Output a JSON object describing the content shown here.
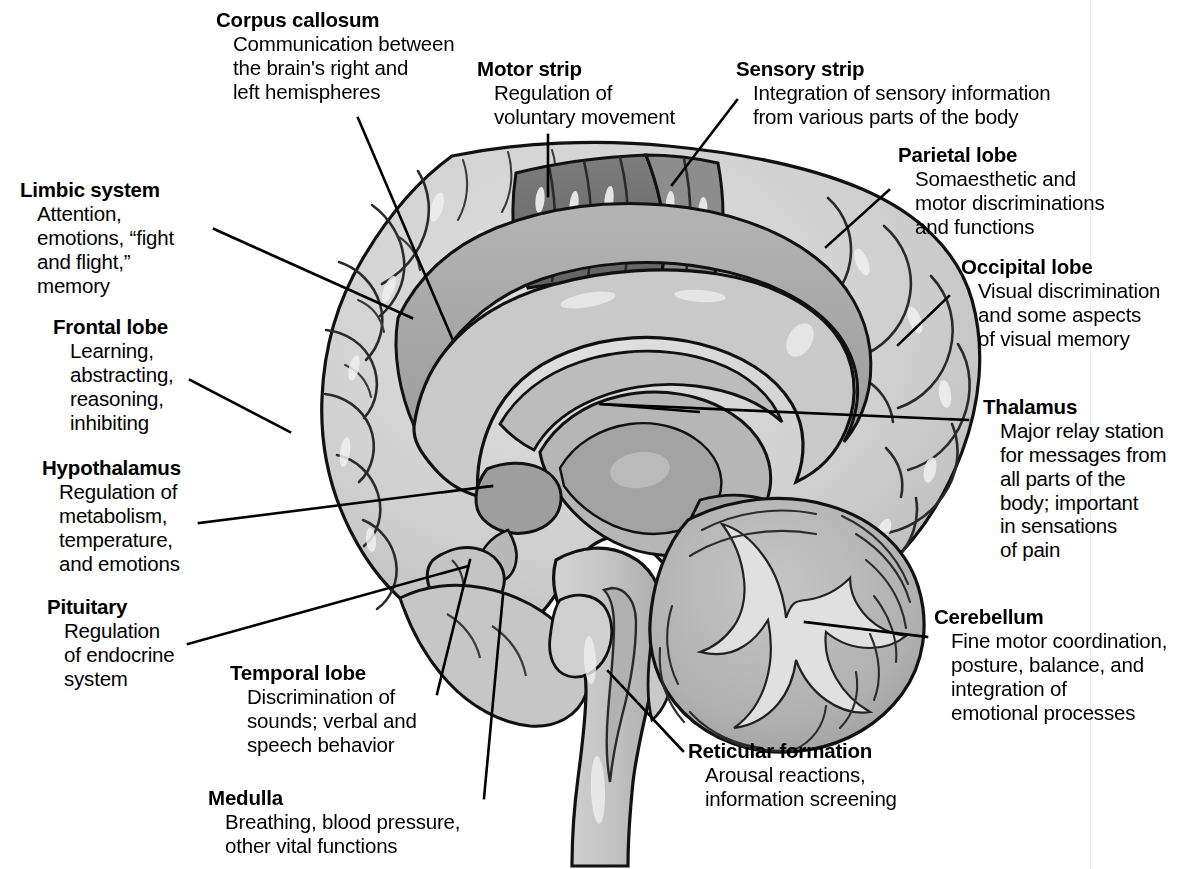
{
  "figure": {
    "background_color": "#ffffff",
    "text_color": "#000000",
    "illustration_style": "grayscale line drawing"
  },
  "palette": {
    "outline": "#111111",
    "cortex_light": "#d0d0d0",
    "cortex_mid": "#bdbdbd",
    "gyrus_band": "#a8a8a8",
    "corpus_callosum": "#c9c9c9",
    "motor_strip_dark": "#6f6f6f",
    "sensory_strip": "#8f8f8f",
    "thalamus": "#b3b3b3",
    "cerebellum": "#b0b0b0",
    "brainstem": "#c4c4c4",
    "highlight": "#f2f2f2"
  },
  "labels": [
    {
      "id": "corpus-callosum",
      "term": "Corpus callosum",
      "description": "Communication between\nthe brain's right and\nleft hemispheres",
      "side": "top-left"
    },
    {
      "id": "motor-strip",
      "term": "Motor strip",
      "description": "Regulation of\nvoluntary movement",
      "side": "top-center"
    },
    {
      "id": "sensory-strip",
      "term": "Sensory strip",
      "description": "Integration of sensory information\nfrom various parts of the body",
      "side": "top-right"
    },
    {
      "id": "parietal-lobe",
      "term": "Parietal lobe",
      "description": "Somaesthetic and\nmotor discriminations\nand functions",
      "side": "right"
    },
    {
      "id": "occipital-lobe",
      "term": "Occipital lobe",
      "description": "Visual discrimination\nand some aspects\nof visual memory",
      "side": "right"
    },
    {
      "id": "thalamus",
      "term": "Thalamus",
      "description": "Major relay station\nfor messages from\nall parts of the\nbody; important\nin sensations\nof pain",
      "side": "right"
    },
    {
      "id": "cerebellum",
      "term": "Cerebellum",
      "description": "Fine motor coordination,\nposture, balance, and\nintegration of\nemotional processes",
      "side": "right"
    },
    {
      "id": "reticular-formation",
      "term": "Reticular formation",
      "description": "Arousal reactions,\ninformation screening",
      "side": "bottom-center"
    },
    {
      "id": "medulla",
      "term": "Medulla",
      "description": "Breathing, blood pressure,\nother vital functions",
      "side": "bottom-left"
    },
    {
      "id": "temporal-lobe",
      "term": "Temporal lobe",
      "description": "Discrimination of\nsounds; verbal and\nspeech behavior",
      "side": "bottom-left"
    },
    {
      "id": "pituitary",
      "term": "Pituitary",
      "description": "Regulation\nof endocrine\nsystem",
      "side": "left"
    },
    {
      "id": "hypothalamus",
      "term": "Hypothalamus",
      "description": "Regulation of\nmetabolism,\ntemperature,\nand emotions",
      "side": "left"
    },
    {
      "id": "frontal-lobe",
      "term": "Frontal lobe",
      "description": "Learning,\nabstracting,\nreasoning,\ninhibiting",
      "side": "left"
    },
    {
      "id": "limbic-system",
      "term": "Limbic system",
      "description": "Attention,\nemotions, “fight\nand flight,”\nmemory",
      "side": "left"
    }
  ]
}
